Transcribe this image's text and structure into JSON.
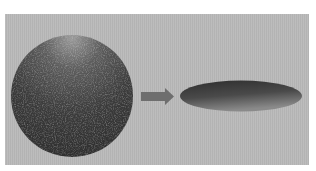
{
  "diagram": {
    "panel": {
      "background": "#b9b9b9"
    },
    "nodes": [
      {
        "id": "sphere",
        "shape": "circle",
        "cx": 72,
        "cy": 96,
        "r": 61,
        "color": "#3a3a3a",
        "highlight": "#8a8a8a"
      },
      {
        "id": "flattened-ellipsoid",
        "shape": "ellipse",
        "cx": 241,
        "cy": 96,
        "rx": 61,
        "ry": 15,
        "color": "#3c3c3c",
        "highlight": "#7a7a7a"
      }
    ],
    "edges": [
      {
        "from": "sphere",
        "to": "flattened-ellipsoid",
        "shape": "block-arrow",
        "color": "#6e6e6e"
      }
    ]
  }
}
